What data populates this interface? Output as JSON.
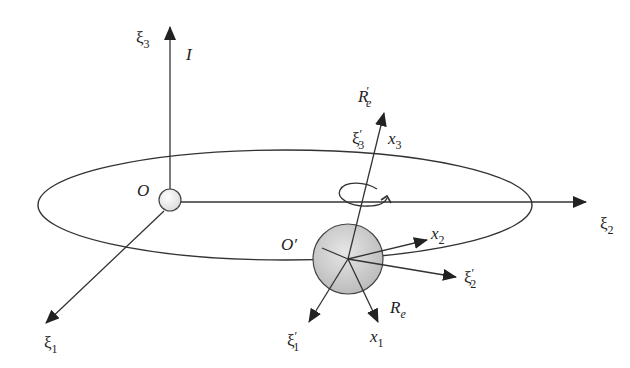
{
  "diagram": {
    "colors": {
      "line": "#333333",
      "origin_sphere_fill": "#eeeeee",
      "body_sphere_fill": "#cfcfcf",
      "background": "#ffffff"
    },
    "labels": {
      "xi3": {
        "base": "ξ",
        "sub": "3"
      },
      "I": "I",
      "O": "O",
      "xi2": {
        "base": "ξ",
        "sub": "2"
      },
      "xi1": {
        "base": "ξ",
        "sub": "1"
      },
      "Re_prime": {
        "base": "R",
        "sub": "e",
        "prime": "′"
      },
      "xi3_prime": {
        "base": "ξ",
        "sub": "3",
        "prime": "′"
      },
      "x3": {
        "base": "x",
        "sub": "3"
      },
      "O_prime": "O′",
      "x2": {
        "base": "x",
        "sub": "2"
      },
      "xi2_prime": {
        "base": "ξ",
        "sub": "2",
        "prime": "′"
      },
      "Re": {
        "base": "R",
        "sub": "e"
      },
      "xi1_prime": {
        "base": "ξ",
        "sub": "1",
        "prime": "′"
      },
      "x1": {
        "base": "x",
        "sub": "1"
      }
    }
  }
}
